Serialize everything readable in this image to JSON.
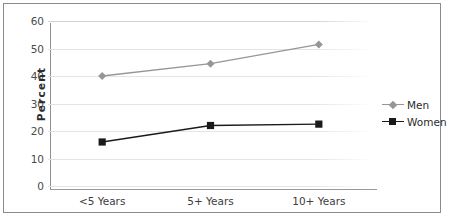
{
  "chart_data": {
    "type": "line",
    "title": "",
    "xlabel": "",
    "ylabel": "Percent",
    "categories": [
      "<5 Years",
      "5+ Years",
      "10+ Years"
    ],
    "ylim": [
      0,
      60
    ],
    "yticks": [
      0,
      10,
      20,
      30,
      40,
      50,
      60
    ],
    "grid": true,
    "legend_position": "right",
    "series": [
      {
        "name": "Men",
        "values": [
          40,
          44.5,
          51.5
        ],
        "color": "#969696",
        "marker": "diamond"
      },
      {
        "name": "Women",
        "values": [
          16,
          22,
          22.5
        ],
        "color": "#1a1a1a",
        "marker": "square"
      }
    ]
  },
  "axes": {
    "y_label": "Percent",
    "y_ticks": [
      "60",
      "50",
      "40",
      "30",
      "20",
      "10",
      "0"
    ],
    "x_ticks": [
      "<5 Years",
      "5+ Years",
      "10+ Years"
    ]
  },
  "legend": {
    "items": [
      {
        "label": "Men",
        "color": "#969696"
      },
      {
        "label": "Women",
        "color": "#1a1a1a"
      }
    ]
  },
  "colors": {
    "men": "#969696",
    "women": "#1a1a1a",
    "grid": "#e2e2e2",
    "axis": "#8f8f8f",
    "frame": "#8a8a8a"
  }
}
